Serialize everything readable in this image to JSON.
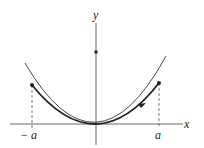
{
  "diagram": {
    "axes": {
      "x_label": "x",
      "y_label": "y"
    },
    "ticks": {
      "neg": "− a",
      "pos": "a"
    },
    "colors": {
      "line": "#333333",
      "curve": "#222222"
    }
  }
}
